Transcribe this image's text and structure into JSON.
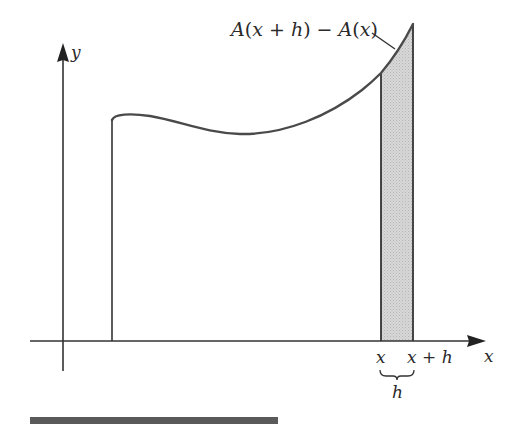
{
  "figure": {
    "axes": {
      "x_label": "x",
      "y_label": "y"
    },
    "annotation": {
      "label": "A(x + h) − A(x)",
      "parts": [
        "A",
        "(",
        "x",
        " + ",
        "h",
        ")",
        " − ",
        "A",
        "(",
        "x",
        ")"
      ]
    },
    "ticks": {
      "x_left": "x",
      "x_right": "x + h",
      "x_right_var": "x",
      "x_right_plus": " + ",
      "x_right_h": "h",
      "brace_label": "h"
    },
    "colors": {
      "line": "#3a3a3a",
      "curve": "#4a4a4a",
      "strip_fill": "#cfcfcf",
      "footer_bar": "#5a5a5a"
    }
  }
}
